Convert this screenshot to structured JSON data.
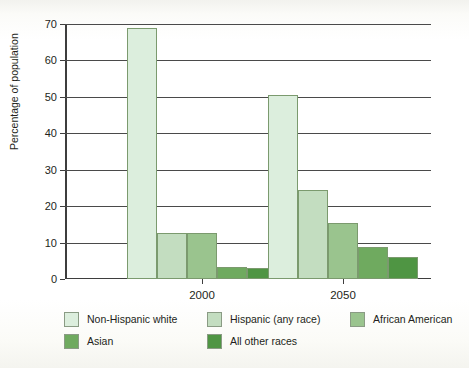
{
  "chart_data": {
    "type": "bar",
    "title": "",
    "xlabel": "",
    "ylabel": "Percentage of population",
    "categories": [
      "2000",
      "2050"
    ],
    "ylim": [
      0,
      70
    ],
    "yticks": [
      0,
      10,
      20,
      30,
      40,
      50,
      60,
      70
    ],
    "grid": true,
    "legend_position": "bottom",
    "series": [
      {
        "name": "Non-Hispanic white",
        "color": "#dceedd",
        "values": [
          69,
          50.5
        ]
      },
      {
        "name": "Hispanic (any race)",
        "color": "#c3ddc0",
        "values": [
          12.6,
          24.5
        ]
      },
      {
        "name": "African  American",
        "color": "#9ac48e",
        "values": [
          12.7,
          15.4
        ]
      },
      {
        "name": "Asian",
        "color": "#6faa5f",
        "values": [
          3.2,
          8.8
        ]
      },
      {
        "name": "All other races",
        "color": "#4f9543",
        "values": [
          3.1,
          6.0
        ]
      }
    ]
  },
  "axis": {
    "ytick_labels": [
      "0",
      "10",
      "20",
      "30",
      "40",
      "50",
      "60",
      "70"
    ],
    "xtick_labels": [
      "2000",
      "2050"
    ],
    "ylabel": "Percentage of population"
  },
  "legend": {
    "items": [
      {
        "label": "Non-Hispanic white",
        "color": "#dceedd"
      },
      {
        "label": "Hispanic (any race)",
        "color": "#c3ddc0"
      },
      {
        "label": "African  American",
        "color": "#9ac48e"
      },
      {
        "label": "Asian",
        "color": "#6faa5f"
      },
      {
        "label": "All other races",
        "color": "#4f9543"
      }
    ]
  }
}
